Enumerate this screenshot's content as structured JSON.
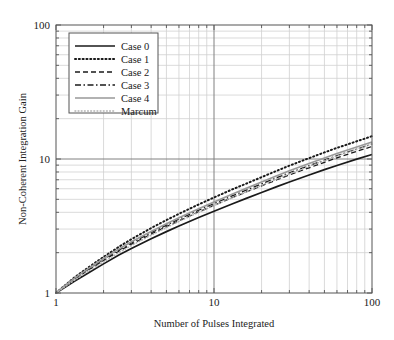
{
  "chart_data": {
    "type": "line",
    "title": "",
    "xlabel": "Number of Pulses Integrated",
    "ylabel": "Non-Coherent Integration Gain",
    "xscale": "log",
    "yscale": "log",
    "xlim": [
      1,
      100
    ],
    "ylim": [
      1,
      100
    ],
    "xticks": [
      1,
      10,
      100
    ],
    "xticklabels": [
      "1",
      "10",
      "100"
    ],
    "yticks": [
      1,
      10,
      100
    ],
    "yticklabels": [
      "1",
      "10",
      "100"
    ],
    "grid": "both-major-and-minor",
    "legend_position": "upper-left",
    "x": [
      1,
      1.3,
      1.6,
      2,
      2.5,
      3,
      4,
      5,
      6,
      8,
      10,
      13,
      16,
      20,
      25,
      30,
      40,
      50,
      60,
      80,
      100
    ],
    "series": [
      {
        "name": "Case 0",
        "style": "solid",
        "color": "#1a1a1a",
        "width": 1.7,
        "values": [
          1.0,
          1.22,
          1.41,
          1.65,
          1.92,
          2.15,
          2.54,
          2.87,
          3.16,
          3.66,
          4.08,
          4.62,
          5.08,
          5.62,
          6.22,
          6.74,
          7.6,
          8.33,
          8.95,
          9.97,
          10.8
        ]
      },
      {
        "name": "Case 1",
        "style": "dotted-thick",
        "color": "#1a1a1a",
        "width": 2.0,
        "values": [
          1.0,
          1.3,
          1.55,
          1.86,
          2.21,
          2.52,
          3.05,
          3.5,
          3.9,
          4.58,
          5.16,
          5.92,
          6.55,
          7.32,
          8.17,
          8.92,
          10.15,
          11.2,
          12.1,
          13.55,
          14.8
        ]
      },
      {
        "name": "Case 2",
        "style": "dashed",
        "color": "#1a1a1a",
        "width": 1.3,
        "values": [
          1.0,
          1.26,
          1.48,
          1.75,
          2.05,
          2.31,
          2.75,
          3.13,
          3.46,
          4.03,
          4.51,
          5.14,
          5.67,
          6.3,
          7.0,
          7.6,
          8.6,
          9.45,
          10.2,
          11.4,
          12.4
        ]
      },
      {
        "name": "Case 3",
        "style": "dashdot",
        "color": "#1a1a1a",
        "width": 1.3,
        "values": [
          1.0,
          1.27,
          1.5,
          1.78,
          2.09,
          2.36,
          2.82,
          3.21,
          3.56,
          4.15,
          4.65,
          5.3,
          5.86,
          6.52,
          7.25,
          7.88,
          8.92,
          9.8,
          10.6,
          11.85,
          12.9
        ]
      },
      {
        "name": "Case 4",
        "style": "solid",
        "color": "#999999",
        "width": 1.7,
        "values": [
          1.0,
          1.28,
          1.52,
          1.81,
          2.13,
          2.41,
          2.88,
          3.29,
          3.65,
          4.26,
          4.78,
          5.46,
          6.04,
          6.73,
          7.5,
          8.16,
          9.25,
          10.18,
          11.0,
          12.3,
          13.4
        ]
      },
      {
        "name": "Marcum",
        "style": "dotted-fine",
        "color": "#b0b0b0",
        "width": 1.5,
        "values": [
          1.0,
          1.24,
          1.45,
          1.71,
          2.0,
          2.26,
          2.7,
          3.08,
          3.42,
          4.0,
          4.49,
          5.13,
          5.69,
          6.35,
          7.1,
          7.75,
          8.82,
          9.73,
          10.55,
          11.85,
          12.95
        ]
      }
    ]
  },
  "colors": {
    "axis": "#555555",
    "grid_major": "#808080",
    "grid_minor": "#d0d0d0",
    "background": "#ffffff"
  }
}
